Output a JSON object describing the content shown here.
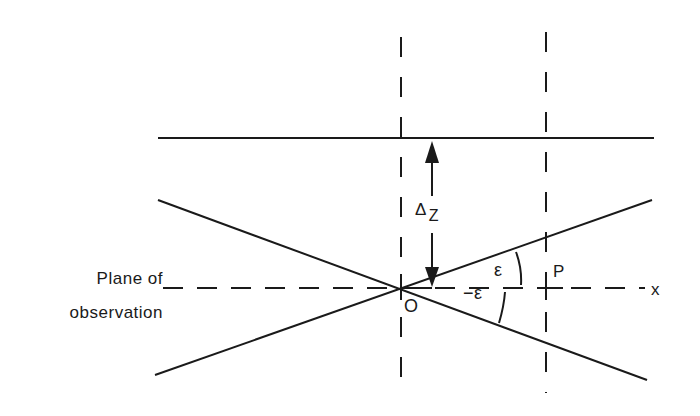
{
  "diagram": {
    "labels": {
      "plane_line1": "Plane of",
      "plane_line2": "observation",
      "delta": "Δ",
      "delta_sub": "Z",
      "origin": "O",
      "point": "P",
      "axis": "x",
      "angle_pos": "ε",
      "angle_neg": "−ε"
    },
    "elements": {
      "horizontal_plane_line": {
        "x1": 158,
        "y1": 138,
        "x2": 654,
        "y2": 138,
        "style": "solid"
      },
      "x_axis": {
        "x1": 163,
        "y1": 288,
        "x2": 645,
        "y2": 288,
        "style": "dashed"
      },
      "vertical_line_O": {
        "x1": 401,
        "y1": 37,
        "x2": 401,
        "y2": 393,
        "style": "dashed"
      },
      "vertical_line_P": {
        "x1": 546,
        "y1": 32,
        "x2": 546,
        "y2": 393,
        "style": "dashed"
      },
      "ray_descending": {
        "x1": 158,
        "y1": 200,
        "x2": 647,
        "y2": 380,
        "style": "solid"
      },
      "ray_ascending": {
        "x1": 155,
        "y1": 375,
        "x2": 652,
        "y2": 200,
        "style": "solid"
      },
      "delta_arrow": {
        "x": 432,
        "top": 140,
        "bottom": 287
      }
    },
    "colors": {
      "ink": "#1a1a1a",
      "background": "#ffffff"
    }
  }
}
